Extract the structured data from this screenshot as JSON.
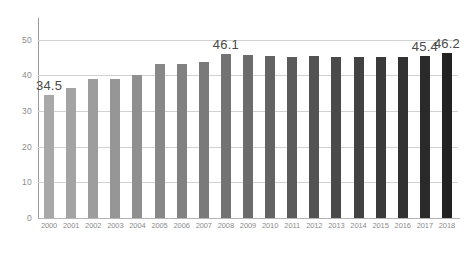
{
  "chart_data": {
    "type": "bar",
    "title": "",
    "subtitle": "",
    "xlabel": "",
    "ylabel": "",
    "categories": [
      "2000",
      "2001",
      "2002",
      "2003",
      "2004",
      "2005",
      "2006",
      "2007",
      "2008",
      "2009",
      "2010",
      "2011",
      "2012",
      "2013",
      "2014",
      "2015",
      "2016",
      "2017",
      "2018"
    ],
    "values": [
      34.5,
      36.6,
      39.0,
      38.9,
      40.2,
      43.3,
      43.1,
      43.7,
      46.1,
      45.7,
      45.6,
      45.2,
      45.6,
      45.2,
      45.2,
      45.1,
      45.2,
      45.4,
      46.2
    ],
    "data_labels": [
      {
        "category": "2000",
        "value": 34.5,
        "text": "34.5"
      },
      {
        "category": "2008",
        "value": 46.1,
        "text": "46.1"
      },
      {
        "category": "2017",
        "value": 45.4,
        "text": "45.4"
      },
      {
        "category": "2018",
        "value": 46.2,
        "text": "46.2"
      }
    ],
    "bar_colors": [
      "#a8a8a8",
      "#a3a3a3",
      "#9d9d9d",
      "#969696",
      "#8f8f8f",
      "#888888",
      "#818181",
      "#7a7a7a",
      "#737373",
      "#6b6b6b",
      "#636363",
      "#5b5b5b",
      "#535353",
      "#4a4a4a",
      "#424242",
      "#3a3a3a",
      "#323232",
      "#2a2a2a",
      "#222222"
    ],
    "ylim": [
      0,
      55
    ],
    "y_ticks": [
      0,
      10,
      20,
      30,
      40,
      50
    ],
    "y_tick_labels": [
      "0",
      "10",
      "20",
      "30",
      "40",
      "50"
    ],
    "grid": true,
    "grid_color": "#d2d2d2",
    "axis_color": "#9a9a9a",
    "tick_label_color": "#8c8c8c",
    "data_label_color": "#4a4a4a",
    "background": "#ffffff",
    "legend": null,
    "legend_position": "none"
  }
}
